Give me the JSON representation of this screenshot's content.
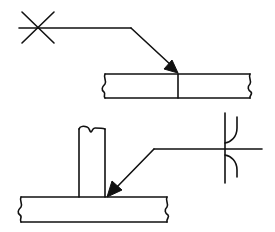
{
  "diagram": {
    "type": "welding-symbols",
    "stroke_color": "#111111",
    "background": "#ffffff",
    "figures": [
      {
        "id": "top",
        "description": "Butt joint between two plates with arrow pointing to joint; weld symbol X (double-V groove / cross mark) at tail of reference line",
        "symbol": "X"
      },
      {
        "id": "bottom",
        "description": "T-joint: vertical plate on horizontal plate, arrow pointing to fillet corner; double-sided J/U-type weld symbol on reference line",
        "symbol": "double-J"
      }
    ]
  }
}
